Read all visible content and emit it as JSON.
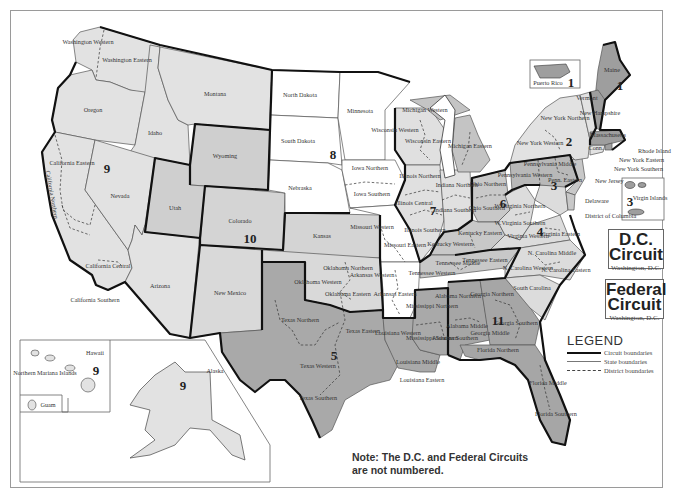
{
  "colors": {
    "circuit_dark": "#9e9e9e",
    "circuit_mid": "#c4c4c4",
    "circuit_light": "#dedede",
    "circuit_white": "#ffffff",
    "boundary": "#111111"
  },
  "circuits": [
    {
      "number": "1",
      "states": [
        "Maine",
        "New Hampshire",
        "Massachusetts",
        "Rhode Island",
        "Puerto Rico"
      ]
    },
    {
      "number": "2",
      "states": [
        "Vermont",
        "Connecticut",
        "New York Northern",
        "New York Western",
        "New York Eastern",
        "New York Southern"
      ]
    },
    {
      "number": "3",
      "states": [
        "Pennsylvania Western",
        "Pennsylvania Middle",
        "Pennsylvania Eastern",
        "New Jersey",
        "Delaware",
        "Virgin Islands"
      ]
    },
    {
      "number": "4",
      "states": [
        "Maryland",
        "W.Virginia Northern",
        "W.Virginia Southern",
        "Virginia Western",
        "Virginia Eastern",
        "N. Carolina Western",
        "N. Carolina Middle",
        "N. Carolina Eastern",
        "South Carolina"
      ]
    },
    {
      "number": "5",
      "states": [
        "Texas Northern",
        "Texas Eastern",
        "Texas Western",
        "Texas Southern",
        "Louisiana Western",
        "Louisiana Middle",
        "Louisiana Eastern",
        "Mississippi Northern",
        "Mississippi Southern"
      ]
    },
    {
      "number": "6",
      "states": [
        "Michigan Western",
        "Michigan Eastern",
        "Ohio Northern",
        "Ohio Southern",
        "Kentucky Western",
        "Kentucky Eastern",
        "Tennessee Western",
        "Tennessee Middle",
        "Tennessee Eastern"
      ]
    },
    {
      "number": "7",
      "states": [
        "Wisconsin Western",
        "Wisconsin Eastern",
        "Illinois Northern",
        "Illinois Central",
        "Illinois Southern",
        "Indiana Northern",
        "Indiana Southern"
      ]
    },
    {
      "number": "8",
      "states": [
        "North Dakota",
        "South Dakota",
        "Nebraska",
        "Minnesota",
        "Iowa Northern",
        "Iowa Southern",
        "Missouri Western",
        "Missouri Eastern",
        "Arkansas Western",
        "Arkansas Eastern"
      ]
    },
    {
      "number": "9",
      "states": [
        "Washington Western",
        "Washington Eastern",
        "Oregon",
        "Idaho",
        "Montana",
        "California Northern",
        "California Eastern",
        "California Central",
        "California Southern",
        "Nevada",
        "Arizona",
        "Alaska",
        "Hawaii",
        "Guam",
        "Northern Mariana Islands"
      ]
    },
    {
      "number": "10",
      "states": [
        "Wyoming",
        "Utah",
        "Colorado",
        "Kansas",
        "New Mexico",
        "Oklahoma Northern",
        "Oklahoma Western",
        "Oklahoma Eastern"
      ]
    },
    {
      "number": "11",
      "states": [
        "Alabama Northern",
        "Alabama Middle",
        "Alabama Southern",
        "Georgia Northern",
        "Georgia Middle",
        "Georgia Southern",
        "Florida Northern",
        "Florida Middle",
        "Florida Southern"
      ]
    }
  ],
  "labels": {
    "wa_w": "Washington Western",
    "wa_e": "Washington Eastern",
    "oregon": "Oregon",
    "idaho": "Idaho",
    "montana": "Montana",
    "ca_n": "California Northern",
    "ca_e": "California Eastern",
    "ca_c": "California Central",
    "ca_s": "California Southern",
    "nevada": "Nevada",
    "arizona": "Arizona",
    "utah": "Utah",
    "wyoming": "Wyoming",
    "colorado": "Colorado",
    "new_mexico": "New Mexico",
    "kansas": "Kansas",
    "nd": "North Dakota",
    "sd": "South Dakota",
    "nebraska": "Nebraska",
    "minnesota": "Minnesota",
    "ia_n": "Iowa Northern",
    "ia_s": "Iowa Southern",
    "mo_w": "Missouri Western",
    "mo_e": "Missouri Eastern",
    "ar_w": "Arkansas Western",
    "ar_e": "Arkansas Eastern",
    "ok_n": "Oklahoma Northern",
    "ok_w": "Oklahoma Western",
    "ok_e": "Oklahoma Eastern",
    "tx_n": "Texas Northern",
    "tx_e": "Texas Eastern",
    "tx_w": "Texas Western",
    "tx_s": "Texas Southern",
    "la_w": "Louisiana Western",
    "la_m": "Louisiana Middle",
    "la_e": "Louisiana Eastern",
    "ms_n": "Mississippi Northern",
    "ms_s": "Mississippi Southern",
    "wi_w": "Wisconsin Western",
    "wi_e": "Wisconsin Eastern",
    "mi_w": "Michigan Western",
    "mi_e": "Michigan Eastern",
    "il_n": "Illinois Northern",
    "il_c": "Illinois Central",
    "il_s": "Illinois Southern",
    "in_n": "Indiana Northern",
    "in_s": "Indiana Southern",
    "oh_n": "Ohio Northern",
    "oh_s": "Ohio Southern",
    "ky_w": "Kentucky Western",
    "ky_e": "Kentucky Eastern",
    "tn_w": "Tennessee Western",
    "tn_m": "Tennessee Middle",
    "tn_e": "Tennessee Eastern",
    "al_n": "Alabama Northern",
    "al_m": "Alabama Middle",
    "al_s": "Alabama Southern",
    "ga_n": "Georgia Northern",
    "ga_m": "Georgia Middle",
    "ga_s": "Georgia Southern",
    "fl_n": "Florida Northern",
    "fl_m": "Florida Middle",
    "fl_s": "Florida Southern",
    "sc": "South Carolina",
    "nc_w": "N. Carolina Western",
    "nc_m": "N. Carolina Middle",
    "nc_e": "N. Carolina Eastern",
    "va_w": "Virginia Western",
    "va_e": "Virginia Eastern",
    "wv_n": "W.Virginia Northern",
    "wv_s": "W.Virginia Southern",
    "pa_w": "Pennsylvania Western",
    "pa_m": "Pennsylvania Middle",
    "pa_e": "Penn. Eastern",
    "ny_n": "New York Northern",
    "ny_w": "New York Western",
    "vermont": "Vermont",
    "nh": "New Hampshire",
    "mass": "Massachusetts",
    "maine": "Maine",
    "conn": "Conn.",
    "ri": "Rhode Island",
    "ny_e": "New York Eastern",
    "ny_s": "New York Southern",
    "nj": "New Jersey",
    "delaware": "Delaware",
    "dc": "District of Columbia",
    "maryland": "Maryland",
    "alaska": "Alaska",
    "hawaii": "Hawaii",
    "nmi": "Northern Mariana Islands",
    "guam": "Guam",
    "puerto_rico": "Puerto Rico",
    "virgin_islands": "Virgin Islands"
  },
  "circuit_numbers": {
    "c1": "1",
    "c2": "2",
    "c3": "3",
    "c4": "4",
    "c5": "5",
    "c6": "6",
    "c7": "7",
    "c8": "8",
    "c9": "9",
    "c10": "10",
    "c11": "11",
    "pr": "1",
    "vi": "3",
    "ak": "9",
    "hi": "9"
  },
  "dc_circuit": {
    "title_line1": "D.C.",
    "title_line2": "Circuit",
    "location": "Washington, D.C."
  },
  "federal_circuit": {
    "title_line1": "Federal",
    "title_line2": "Circuit",
    "location": "Washington, D.C."
  },
  "legend": {
    "heading": "LEGEND",
    "items": [
      {
        "label": "Circuit boundaries",
        "style": "thick-solid"
      },
      {
        "label": "State boundaries",
        "style": "thin-solid"
      },
      {
        "label": "District boundaries",
        "style": "dashed"
      }
    ]
  },
  "note": {
    "line1": "Note: The D.C. and Federal Circuits",
    "line2": "are not numbered."
  }
}
